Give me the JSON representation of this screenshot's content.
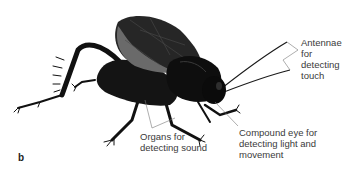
{
  "figure": {
    "panel_letter": "b",
    "labels": [
      {
        "id": "antennae",
        "text": "Antennae\nfor\ndetecting\ntouch"
      },
      {
        "id": "organs",
        "text": "Organs for\ndetecting sound"
      },
      {
        "id": "eye",
        "text": "Compound eye  for\ndetecting light and\nmovement"
      }
    ]
  },
  "colors": {
    "body": "#111111",
    "wing": "#2b2b2b",
    "wing_highlight": "#6a6a6a",
    "leader_line": "#777777",
    "label_text": "#3a3a3a"
  }
}
